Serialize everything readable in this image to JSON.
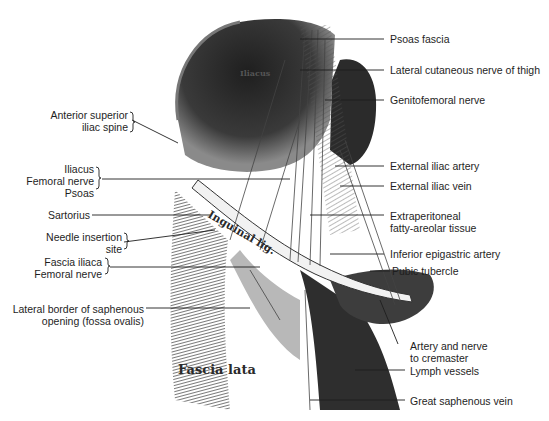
{
  "figure": {
    "inscriptions": {
      "iliacus": "Iliacus",
      "inguinal_ligament": "Inguinal lig.",
      "fascia_lata": "Fascia lata"
    },
    "labels_left": [
      {
        "id": "asis",
        "lines": [
          "Anterior superior",
          "iliac spine"
        ],
        "bracket": true
      },
      {
        "id": "iliacus-group",
        "lines": [
          "Iliacus",
          "Femoral nerve",
          "Psoas"
        ],
        "bracket": true
      },
      {
        "id": "sartorius",
        "lines": [
          "Sartorius"
        ],
        "bracket": false
      },
      {
        "id": "needle-site",
        "lines": [
          "Needle insertion",
          "site"
        ],
        "bracket": true
      },
      {
        "id": "fascia-iliaca-group",
        "lines": [
          "Fascia iliaca",
          "Femoral nerve"
        ],
        "bracket": true
      },
      {
        "id": "saphenous-opening",
        "lines": [
          "Lateral border of saphenous",
          "opening (fossa ovalis)"
        ],
        "bracket": false
      }
    ],
    "labels_right": [
      {
        "id": "psoas-fascia",
        "lines": [
          "Psoas fascia"
        ]
      },
      {
        "id": "lat-cut-nerve",
        "lines": [
          "Lateral cutaneous nerve of thigh"
        ]
      },
      {
        "id": "genitofemoral",
        "lines": [
          "Genitofemoral nerve"
        ]
      },
      {
        "id": "ext-iliac-artery",
        "lines": [
          "External iliac artery"
        ]
      },
      {
        "id": "ext-iliac-vein",
        "lines": [
          "External iliac vein"
        ]
      },
      {
        "id": "extraperitoneal",
        "lines": [
          "Extraperitoneal",
          "fatty-areolar tissue"
        ]
      },
      {
        "id": "inf-epigastric",
        "lines": [
          "Inferior epigastric artery"
        ]
      },
      {
        "id": "pubic-tubercle",
        "lines": [
          "Pubic tubercle"
        ]
      },
      {
        "id": "cremaster",
        "lines": [
          "Artery and nerve",
          "to cremaster"
        ]
      },
      {
        "id": "lymph",
        "lines": [
          "Lymph vessels"
        ]
      },
      {
        "id": "great-saphenous",
        "lines": [
          "Great saphenous vein"
        ]
      }
    ],
    "colors": {
      "ink": "#1e1e1e",
      "shade_dark": "#2b2b2b",
      "shade_mid": "#6e6e6e",
      "shade_light": "#bdbdbd",
      "paper": "#ffffff"
    }
  }
}
